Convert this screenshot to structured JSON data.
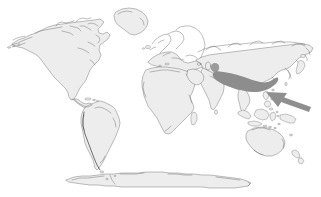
{
  "figure": {
    "width": 321,
    "height": 197,
    "background_color": "#ffffff",
    "caption": ""
  },
  "legend": {
    "land_fill_color": "#ededed",
    "land_outline_color": "#6e6e6e",
    "range_fill_color": "#8d8d8d",
    "arrow_fill_color": "#8f8f8f"
  },
  "map_data": {
    "type": "world-outline-map",
    "projection": "equirectangular",
    "landmasses": [
      {
        "name": "north-america",
        "label": "North America"
      },
      {
        "name": "south-america",
        "label": "South America"
      },
      {
        "name": "greenland",
        "label": "Greenland"
      },
      {
        "name": "europe",
        "label": "Europe"
      },
      {
        "name": "africa",
        "label": "Africa"
      },
      {
        "name": "asia",
        "label": "Asia"
      },
      {
        "name": "australia",
        "label": "Australia"
      },
      {
        "name": "new-zealand",
        "label": "New Zealand"
      },
      {
        "name": "antarctica",
        "label": "Antarctica"
      },
      {
        "name": "indonesia",
        "label": "Indonesia"
      },
      {
        "name": "philippines",
        "label": "Philippines"
      },
      {
        "name": "japan",
        "label": "Japan"
      },
      {
        "name": "madagascar",
        "label": "Madagascar"
      },
      {
        "name": "british-isles",
        "label": "British Isles"
      }
    ],
    "annotations": [
      {
        "name": "distribution-range",
        "label": "Shaded distribution range",
        "shape": "tapering-wedge",
        "region": "Central Asia to Indochina and South China",
        "fill": "#8d8d8d"
      },
      {
        "name": "range-outlier-dot",
        "label": "Isolated range spot",
        "shape": "ellipse",
        "region": "Central Asia",
        "fill": "#9a9a9a"
      },
      {
        "name": "locator-arrow",
        "label": "Arrow pointing to the Philippines",
        "shape": "arrow",
        "direction": "northwest",
        "target_region": "Philippines",
        "fill": "#8f8f8f"
      }
    ]
  }
}
